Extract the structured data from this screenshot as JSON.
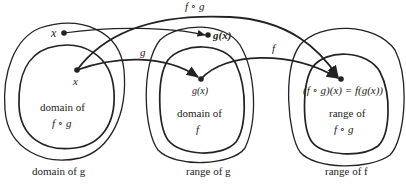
{
  "diagram": {
    "colors": {
      "ink": "#222222",
      "background": "#ffffff"
    },
    "points": {
      "x_outer": "x",
      "x_inner": "x",
      "gx_top": "g(x)",
      "gx_mid": "g(x)",
      "result": "(f ∘ g)(x) = f(g(x))"
    },
    "arrows": {
      "fog": "f ∘ g",
      "g": "g",
      "f": "f"
    },
    "regions": {
      "left_inner_line1": "domain of",
      "left_inner_line2": "f ∘ g",
      "mid_inner_line1": "domain of",
      "mid_inner_line2": "f",
      "right_inner_line1": "range of",
      "right_inner_line2": "f ∘ g"
    },
    "captions": {
      "left": "domain of g",
      "mid": "range of g",
      "right": "range of f"
    }
  }
}
